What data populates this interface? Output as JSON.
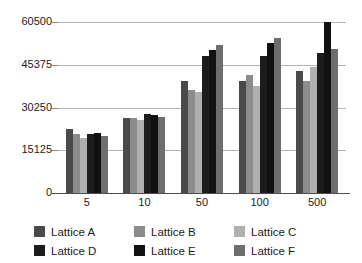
{
  "chart_data": {
    "type": "bar",
    "title": "",
    "xlabel": "",
    "ylabel": "",
    "categories": [
      "5",
      "10",
      "50",
      "100",
      "500"
    ],
    "ylim": [
      0,
      60500
    ],
    "yticks": [
      0,
      15125,
      30250,
      45375,
      60500
    ],
    "ytick_labels": [
      "0",
      "15125",
      "30250",
      "45375",
      "60500"
    ],
    "grid": true,
    "legend_position": "bottom",
    "series": [
      {
        "name": "Lattice A",
        "color": "#4a4a4a",
        "values": [
          22500,
          26500,
          39500,
          39800,
          43000
        ]
      },
      {
        "name": "Lattice B",
        "color": "#8c8c8c",
        "values": [
          20800,
          26500,
          36500,
          41800,
          39500
        ]
      },
      {
        "name": "Lattice C",
        "color": "#b0b0b0",
        "values": [
          19400,
          25700,
          35800,
          37800,
          44500
        ]
      },
      {
        "name": "Lattice D",
        "color": "#1c1c1c",
        "values": [
          20800,
          28000,
          48500,
          48500,
          49500
        ]
      },
      {
        "name": "Lattice E",
        "color": "#111111",
        "values": [
          21200,
          27500,
          50500,
          53000,
          60400
        ]
      },
      {
        "name": "Lattice F",
        "color": "#6e6e6e",
        "values": [
          20000,
          27000,
          52500,
          55000,
          51000
        ]
      }
    ]
  },
  "legend": {
    "items": [
      {
        "label": "Lattice A",
        "color": "#4a4a4a"
      },
      {
        "label": "Lattice B",
        "color": "#8c8c8c"
      },
      {
        "label": "Lattice C",
        "color": "#b0b0b0"
      },
      {
        "label": "Lattice D",
        "color": "#1c1c1c"
      },
      {
        "label": "Lattice E",
        "color": "#111111"
      },
      {
        "label": "Lattice F",
        "color": "#6e6e6e"
      }
    ],
    "order": [
      0,
      3,
      1,
      4,
      2,
      5
    ]
  },
  "colors": {
    "gridline": "#b4b4b4",
    "axis": "#4d4d4d",
    "text": "#1a1a1a",
    "background": "#ffffff"
  }
}
